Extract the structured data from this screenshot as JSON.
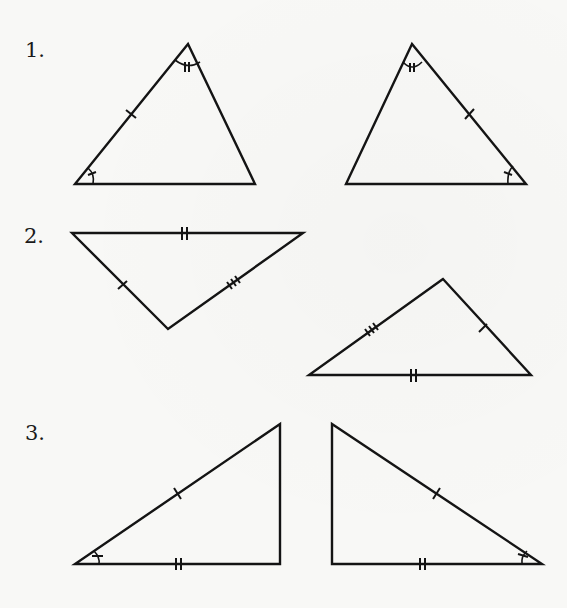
{
  "page": {
    "type": "geometry-exercise",
    "instruction_context": "Pairs of triangles with congruence markings"
  },
  "problems": [
    {
      "number": "1.",
      "description": "Two triangles, each with one single-tick side, one single-arc angle and one double-tick angle",
      "triangles": [
        {
          "id": "1a",
          "vertices": [
            [
              188,
              44
            ],
            [
              75,
              184
            ],
            [
              255,
              184
            ]
          ],
          "marks": {
            "sides": [
              {
                "side": "left",
                "ticks": 1
              }
            ],
            "angles": [
              {
                "vertex": "top",
                "arc_ticks": 2
              },
              {
                "vertex": "bottom-left",
                "arc_ticks": 1
              }
            ]
          }
        },
        {
          "id": "1b",
          "vertices": [
            [
              412,
              44
            ],
            [
              346,
              184
            ],
            [
              526,
              184
            ]
          ],
          "marks": {
            "sides": [
              {
                "side": "right",
                "ticks": 1
              }
            ],
            "angles": [
              {
                "vertex": "top",
                "arc_ticks": 2
              },
              {
                "vertex": "bottom-right",
                "arc_ticks": 1
              }
            ]
          }
        }
      ]
    },
    {
      "number": "2.",
      "description": "Two triangles with all three sides marked (1, 2 and 3 ticks)",
      "triangles": [
        {
          "id": "2a",
          "vertices": [
            [
              72,
              233
            ],
            [
              303,
              233
            ],
            [
              168,
              329
            ]
          ],
          "marks": {
            "sides": [
              {
                "side": "top",
                "ticks": 2
              },
              {
                "side": "left",
                "ticks": 1
              },
              {
                "side": "right",
                "ticks": 3
              }
            ]
          }
        },
        {
          "id": "2b",
          "vertices": [
            [
              443,
              279
            ],
            [
              309,
              375
            ],
            [
              531,
              375
            ]
          ],
          "marks": {
            "sides": [
              {
                "side": "bottom",
                "ticks": 2
              },
              {
                "side": "right",
                "ticks": 1
              },
              {
                "side": "left",
                "ticks": 3
              }
            ]
          }
        }
      ]
    },
    {
      "number": "3.",
      "description": "Two right triangles with hypotenuse (1 tick), base (2 ticks) and acute angle marked",
      "triangles": [
        {
          "id": "3a",
          "vertices": [
            [
              75,
              564
            ],
            [
              280,
              564
            ],
            [
              280,
              424
            ]
          ],
          "marks": {
            "sides": [
              {
                "side": "hypotenuse",
                "ticks": 1
              },
              {
                "side": "bottom",
                "ticks": 2
              }
            ],
            "angles": [
              {
                "vertex": "bottom-left",
                "arc_ticks": 1
              }
            ]
          }
        },
        {
          "id": "3b",
          "vertices": [
            [
              332,
              424
            ],
            [
              332,
              564
            ],
            [
              542,
              564
            ]
          ],
          "marks": {
            "sides": [
              {
                "side": "hypotenuse",
                "ticks": 1
              },
              {
                "side": "bottom",
                "ticks": 2
              }
            ],
            "angles": [
              {
                "vertex": "bottom-right",
                "arc_ticks": 1
              }
            ]
          }
        }
      ]
    }
  ],
  "colors": {
    "ink": "#141414",
    "paper": "#f8f8f6"
  }
}
